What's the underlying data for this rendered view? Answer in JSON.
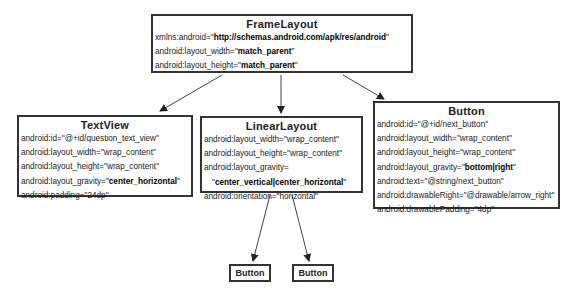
{
  "diagram": {
    "nodes": {
      "frame_layout": {
        "title": "FrameLayout",
        "attrs": [
          {
            "key": "xmlns:android=\"",
            "value": "http://schemas.android.com/apk/res/android",
            "suffix": "\"",
            "bold": true
          },
          {
            "key": "android:layout_width=\"",
            "value": "match_parent",
            "suffix": "\"",
            "bold": true
          },
          {
            "key": "android:layout_height=\"",
            "value": "match_parent",
            "suffix": "\"",
            "bold": true
          }
        ]
      },
      "text_view": {
        "title": "TextView",
        "attrs": [
          {
            "key": "android:id=\"@+id/question_text_view\"",
            "value": "",
            "suffix": "",
            "bold": false
          },
          {
            "key": "android:layout_width=\"wrap_content\"",
            "value": "",
            "suffix": "",
            "bold": false
          },
          {
            "key": "android:layout_height=\"wrap_content\"",
            "value": "",
            "suffix": "",
            "bold": false
          },
          {
            "key": "android:layout_gravity=\"",
            "value": "center_horizontal",
            "suffix": "\"",
            "bold": true
          },
          {
            "key": "android:padding=\"24dp\"",
            "value": "",
            "suffix": "",
            "bold": false
          }
        ]
      },
      "linear_layout": {
        "title": "LinearLayout",
        "attrs": [
          {
            "key": "android:layout_width=\"wrap_content\"",
            "value": "",
            "suffix": "",
            "bold": false
          },
          {
            "key": "android:layout_height=\"wrap_content\"",
            "value": "",
            "suffix": "",
            "bold": false
          },
          {
            "key": "android:layout_gravity=",
            "value": "",
            "suffix": "",
            "bold": false
          },
          {
            "key": "\"",
            "value": "center_vertical|center_horizontal",
            "suffix": "\"",
            "bold": true,
            "indent": true
          },
          {
            "key": "android:orientation=\"horizontal\"",
            "value": "",
            "suffix": "",
            "bold": false
          }
        ]
      },
      "button": {
        "title": "Button",
        "attrs": [
          {
            "key": "android:id=\"@+id/next_button\"",
            "value": "",
            "suffix": "",
            "bold": false
          },
          {
            "key": "android:layout_width=\"wrap_content\"",
            "value": "",
            "suffix": "",
            "bold": false
          },
          {
            "key": "android:layout_height=\"wrap_content\"",
            "value": "",
            "suffix": "",
            "bold": false
          },
          {
            "key": "android:layout_gravity=\"",
            "value": "bottom|right",
            "suffix": "\"",
            "bold": true
          },
          {
            "key": "android:text=\"@string/next_button\"",
            "value": "",
            "suffix": "",
            "bold": false
          },
          {
            "key": "android:drawableRight=\"@drawable/arrow_right\"",
            "value": "",
            "suffix": "",
            "bold": false
          },
          {
            "key": "android:drawablePadding=\"4dp\"",
            "value": "",
            "suffix": "",
            "bold": false
          }
        ]
      },
      "child_button_1": {
        "title": "Button"
      },
      "child_button_2": {
        "title": "Button"
      }
    },
    "edges": [
      {
        "from": "FrameLayout",
        "to": "TextView"
      },
      {
        "from": "FrameLayout",
        "to": "LinearLayout"
      },
      {
        "from": "FrameLayout",
        "to": "Button"
      },
      {
        "from": "LinearLayout",
        "to": "Button (child 1)"
      },
      {
        "from": "LinearLayout",
        "to": "Button (child 2)"
      }
    ],
    "colors": {
      "border": "#333333",
      "text": "#1a1a1a",
      "background": "#ffffff"
    }
  }
}
